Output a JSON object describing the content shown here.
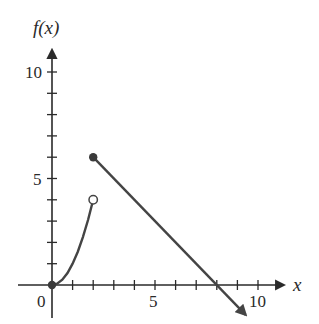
{
  "chart_data": {
    "type": "line",
    "title": "",
    "xlabel": "x",
    "ylabel": "f(x)",
    "xlim": [
      -1.5,
      11.5
    ],
    "ylim": [
      -1.8,
      11.5
    ],
    "x_ticks": [
      1,
      2,
      3,
      4,
      5,
      6,
      7,
      8,
      9,
      10
    ],
    "x_tick_labels": [
      {
        "value": 0,
        "label": "0"
      },
      {
        "value": 5,
        "label": "5"
      },
      {
        "value": 10,
        "label": "10"
      }
    ],
    "y_ticks": [
      1,
      2,
      3,
      4,
      5,
      6,
      7,
      8,
      9,
      10
    ],
    "y_tick_labels": [
      {
        "value": 5,
        "label": "5"
      },
      {
        "value": 10,
        "label": "10"
      }
    ],
    "grid": false,
    "legend": null,
    "series": [
      {
        "name": "piece-1",
        "description": "curve f(x) = x^2 on [0, 2)",
        "x": [
          0,
          0.25,
          0.5,
          0.75,
          1,
          1.25,
          1.5,
          1.75,
          2
        ],
        "y": [
          0,
          0.0625,
          0.25,
          0.5625,
          1,
          1.5625,
          2.25,
          3.0625,
          4
        ],
        "start_point": {
          "x": 0,
          "y": 0,
          "marker": "closed"
        },
        "end_point": {
          "x": 2,
          "y": 4,
          "marker": "open"
        }
      },
      {
        "name": "piece-2",
        "description": "line f(x) = -x + 8 for x >= 2, continues with arrow",
        "x": [
          2,
          8,
          9.4
        ],
        "y": [
          6,
          0,
          -1.4
        ],
        "start_point": {
          "x": 2,
          "y": 6,
          "marker": "closed"
        },
        "end_arrow": true
      }
    ]
  },
  "labels": {
    "y_axis": "f(x)",
    "x_axis": "x",
    "origin": "0",
    "x5": "5",
    "x10": "10",
    "y5": "5",
    "y10": "10"
  },
  "colors": {
    "axis": "#2a2a2a",
    "curve": "#444444",
    "point": "#3a3a3a"
  }
}
